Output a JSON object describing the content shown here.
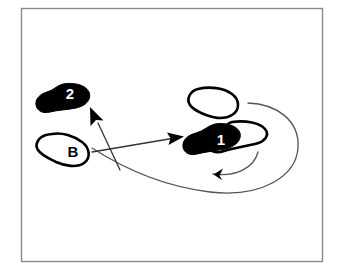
{
  "figure": {
    "background_color": "#ffffff",
    "frame": {
      "name": "diagram-frame",
      "stroke_color": "#8a8a8a",
      "fill_color": "#ffffff",
      "x": 21,
      "y": 8,
      "width": 302,
      "height": 254
    },
    "ink_color": "#000000",
    "line_color": "#4a4a4a"
  },
  "footprints": [
    {
      "id": "footprint-2",
      "label": "2",
      "style": "filled",
      "fill": "#000000",
      "label_color": "#ffffff",
      "position": "upper-left",
      "label_x": 70,
      "label_y": 98
    },
    {
      "id": "footprint-b",
      "label": "B",
      "style": "outline",
      "fill": "#ffffff",
      "label_color": "#000000",
      "position": "lower-left",
      "label_x": 73,
      "label_y": 155
    },
    {
      "id": "footprint-upper-right",
      "label": "",
      "style": "outline",
      "fill": "#ffffff",
      "label_color": "#000000",
      "position": "upper-right",
      "label_x": 0,
      "label_y": 0
    },
    {
      "id": "footprint-1",
      "label": "1",
      "style": "filled",
      "fill": "#000000",
      "label_color": "#ffffff",
      "position": "center-right",
      "label_x": 222,
      "label_y": 144
    },
    {
      "id": "footprint-1-partner",
      "label": "",
      "style": "outline",
      "fill": "#ffffff",
      "label_color": "#000000",
      "position": "center-right-overlap",
      "label_x": 0,
      "label_y": 0
    }
  ],
  "arrows": [
    {
      "id": "arrow-to-2",
      "kind": "straight",
      "from": "footprint-b",
      "to": "footprint-2",
      "direction": "up-left"
    },
    {
      "id": "arrow-to-1",
      "kind": "straight",
      "from": "footprint-b",
      "to": "footprint-1",
      "direction": "right"
    },
    {
      "id": "arrow-sweep-curve",
      "kind": "curved",
      "from": "footprint-b",
      "to": "footprint-1",
      "direction": "clockwise-sweep"
    }
  ]
}
